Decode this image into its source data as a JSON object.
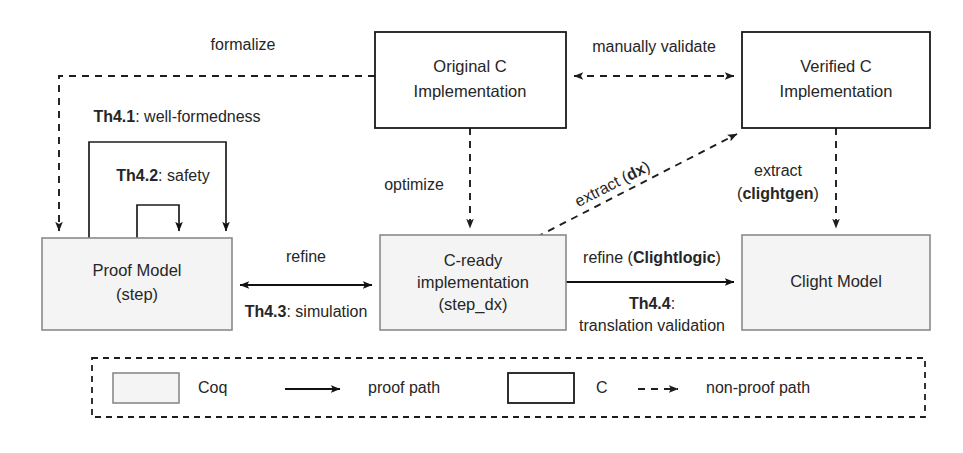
{
  "figure": {
    "type": "diagram",
    "kind": "verification-workflow-flowchart",
    "background": "#ffffff"
  },
  "colors": {
    "coq_fill": "#f4f4f4",
    "coq_stroke": "#8a8a8a",
    "c_fill": "#ffffff",
    "c_stroke": "#1a1a1a",
    "line": "#1d1d1d",
    "text": "#262626"
  },
  "nodes": [
    {
      "id": "original-c",
      "kind": "c",
      "lines": [
        "Original C",
        "Implementation"
      ],
      "line1": "Original C",
      "line2": "Implementation"
    },
    {
      "id": "verified-c",
      "kind": "c",
      "lines": [
        "Verified C",
        "Implementation"
      ],
      "line1": "Verified C",
      "line2": "Implementation"
    },
    {
      "id": "proof-model",
      "kind": "coq",
      "lines": [
        "Proof Model",
        "(step)"
      ],
      "line1": "Proof Model",
      "line2": "(step)"
    },
    {
      "id": "c-ready",
      "kind": "coq",
      "lines": [
        "C-ready",
        "implementation",
        "(step_dx)"
      ],
      "line1": "C-ready",
      "line2": "implementation",
      "line3": "(step_dx)"
    },
    {
      "id": "clight-model",
      "kind": "coq",
      "lines": [
        "Clight Model"
      ],
      "line1": "Clight Model"
    }
  ],
  "edges": {
    "formalize": {
      "label": "formalize",
      "style": "non-proof path",
      "from": "original-c",
      "to": "proof-model"
    },
    "manually_validate": {
      "label": "manually validate",
      "style": "non-proof path",
      "from": "original-c",
      "to": "verified-c",
      "bidirectional": true
    },
    "optimize": {
      "label": "optimize",
      "style": "non-proof path",
      "from": "original-c",
      "to": "c-ready"
    },
    "extract_dx": {
      "label_plain": "extract (",
      "label_bold": "dx",
      "label_close": ")",
      "label_full": "extract (dx)",
      "style": "non-proof path",
      "from": "c-ready",
      "to": "verified-c"
    },
    "extract_clightgen": {
      "label_line1": "extract",
      "label_line2": "(clightgen)",
      "label_bold": "clightgen",
      "style": "non-proof path",
      "from": "verified-c",
      "to": "clight-model"
    },
    "refine_sim": {
      "label_top": "refine",
      "label_bottom_bold": "Th4.3",
      "label_bottom_rest": ": simulation",
      "style": "proof path",
      "from": "proof-model",
      "to": "c-ready",
      "bidirectional": true
    },
    "refine_clightlogic": {
      "label_top_plain": "refine (",
      "label_top_bold": "Clightlogic",
      "label_top_close": ")",
      "label_mid_bold": "Th4.4",
      "label_mid_rest": ":",
      "label_bottom": "translation validation",
      "style": "proof path",
      "from": "c-ready",
      "to": "clight-model"
    },
    "th41": {
      "label_bold": "Th4.1",
      "label_rest": ": well-formedness",
      "style": "proof path",
      "self_loop_on": "proof-model"
    },
    "th42": {
      "label_bold": "Th4.2",
      "label_rest": ": safety",
      "style": "proof path",
      "self_loop_on": "proof-model"
    }
  },
  "legend": {
    "items": [
      {
        "id": "coq",
        "symbol": "filled-box",
        "label": "Coq"
      },
      {
        "id": "proof-path",
        "symbol": "solid-arrow",
        "label": "proof path"
      },
      {
        "id": "c",
        "symbol": "outline-box",
        "label": "C"
      },
      {
        "id": "non-proof-path",
        "symbol": "dashed-arrow",
        "label": "non-proof path"
      }
    ]
  }
}
